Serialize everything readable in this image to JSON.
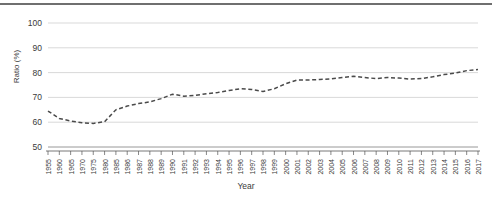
{
  "chart_data": {
    "type": "line",
    "title": "",
    "xlabel": "Year",
    "ylabel": "Ratio (%)",
    "ylim": [
      50,
      100
    ],
    "yticks": [
      50,
      60,
      70,
      80,
      90,
      100
    ],
    "grid": true,
    "legend": "none",
    "line_style": "dashed",
    "line_color": "#4a4a4a",
    "categories": [
      "1955",
      "1960",
      "1965",
      "1970",
      "1975",
      "1980",
      "1985",
      "1986",
      "1987",
      "1988",
      "1989",
      "1990",
      "1991",
      "1992",
      "1993",
      "1994",
      "1995",
      "1996",
      "1997",
      "1998",
      "1999",
      "2000",
      "2001",
      "2002",
      "2003",
      "2004",
      "2005",
      "2006",
      "2007",
      "2008",
      "2009",
      "2010",
      "2011",
      "2012",
      "2013",
      "2014",
      "2015",
      "2016",
      "2017"
    ],
    "values": [
      64.5,
      61.5,
      60.5,
      59.8,
      59.5,
      60.2,
      65.0,
      66.5,
      67.5,
      68.2,
      69.5,
      71.3,
      70.5,
      70.8,
      71.5,
      72.0,
      72.8,
      73.5,
      73.2,
      72.4,
      73.5,
      75.5,
      77.0,
      77.0,
      77.2,
      77.5,
      78.0,
      78.5,
      78.0,
      77.6,
      78.0,
      77.8,
      77.4,
      77.6,
      78.3,
      79.2,
      79.8,
      80.8,
      81.2
    ]
  },
  "axes": {
    "y_axis_title": "Ratio (%)",
    "x_axis_title": "Year"
  }
}
